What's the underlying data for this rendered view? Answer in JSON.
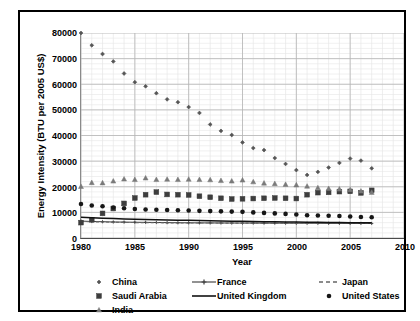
{
  "chart_data": {
    "type": "scatter",
    "title": "",
    "xlabel": "Year",
    "ylabel": "Energy Intensity (BTU per 2005 US$)",
    "xlim": [
      1980,
      2010
    ],
    "ylim": [
      0,
      80000
    ],
    "xticks": [
      "1980",
      "1985",
      "1990",
      "1995",
      "2000",
      "2005",
      "2010"
    ],
    "yticks": [
      "0",
      "10000",
      "20000",
      "30000",
      "40000",
      "50000",
      "60000",
      "70000",
      "80000"
    ],
    "grid": true,
    "legend_position": "bottom",
    "x": [
      1980,
      1981,
      1982,
      1983,
      1984,
      1985,
      1986,
      1987,
      1988,
      1989,
      1990,
      1991,
      1992,
      1993,
      1994,
      1995,
      1996,
      1997,
      1998,
      1999,
      2000,
      2001,
      2002,
      2003,
      2004,
      2005,
      2006,
      2007
    ],
    "series": [
      {
        "name": "China",
        "marker": "small-diamond",
        "color": "#555555",
        "values": [
          80000,
          75200,
          71800,
          68900,
          64200,
          60800,
          59200,
          56500,
          54100,
          53000,
          51100,
          48800,
          44300,
          41800,
          40200,
          37300,
          35100,
          34300,
          31200,
          28900,
          26500,
          24600,
          25800,
          27500,
          29300,
          31000,
          30200,
          27200
        ]
      },
      {
        "name": "France",
        "marker": "line-with-cross",
        "color": "#3a3a3a",
        "values": [
          6600,
          6450,
          6350,
          6250,
          6200,
          6150,
          6100,
          6050,
          6000,
          5950,
          5930,
          5900,
          5880,
          5860,
          5850,
          5840,
          5830,
          5810,
          5800,
          5790,
          5780,
          5760,
          5750,
          5740,
          5730,
          5720,
          5700,
          5680
        ]
      },
      {
        "name": "Japan",
        "marker": "dashed-line",
        "color": "#666666",
        "values": [
          6500,
          6350,
          6250,
          6150,
          6080,
          6020,
          5980,
          5940,
          5900,
          5880,
          5860,
          5840,
          5830,
          5820,
          5810,
          5800,
          5790,
          5780,
          5770,
          5760,
          5750,
          5740,
          5730,
          5720,
          5710,
          5700,
          5690,
          5680
        ]
      },
      {
        "name": "Saudi Arabia",
        "marker": "square",
        "color": "#3d3d3d",
        "values": [
          6000,
          7100,
          9600,
          11500,
          13500,
          15600,
          16900,
          17900,
          17000,
          16900,
          16800,
          16300,
          15900,
          15500,
          15200,
          15300,
          15400,
          15500,
          15600,
          15500,
          15400,
          16900,
          17700,
          17800,
          18100,
          18200,
          17600,
          18600
        ]
      },
      {
        "name": "United Kingdom",
        "marker": "solid-line",
        "color": "#111111",
        "values": [
          8100,
          7900,
          7750,
          7600,
          7450,
          7350,
          7250,
          7150,
          7050,
          6950,
          6880,
          6800,
          6720,
          6650,
          6580,
          6500,
          6440,
          6380,
          6320,
          6260,
          6200,
          6150,
          6100,
          6060,
          6020,
          5990,
          5960,
          5940
        ]
      },
      {
        "name": "United States",
        "marker": "filled-circle",
        "color": "#161616",
        "values": [
          13300,
          12700,
          12400,
          11900,
          11600,
          11300,
          11100,
          11000,
          10900,
          10800,
          10700,
          10600,
          10500,
          10400,
          10300,
          10200,
          10000,
          9800,
          9600,
          9400,
          9200,
          8900,
          8800,
          8700,
          8600,
          8400,
          8200,
          8100
        ]
      },
      {
        "name": "India",
        "marker": "triangle",
        "color": "#7a7a7a",
        "values": [
          20100,
          21600,
          21500,
          22200,
          23000,
          22800,
          23400,
          22800,
          22900,
          22800,
          22900,
          22800,
          22700,
          22400,
          22200,
          22600,
          21900,
          21400,
          21200,
          20900,
          20700,
          20200,
          19600,
          19300,
          19100,
          18800,
          18300,
          17800
        ]
      }
    ]
  }
}
